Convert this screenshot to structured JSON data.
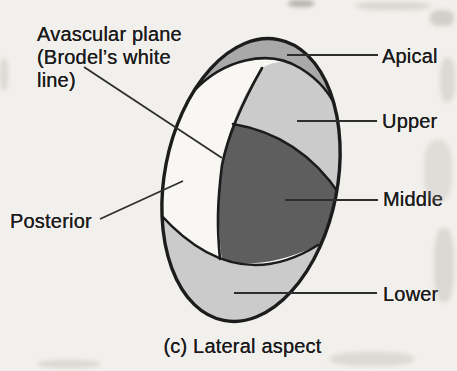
{
  "figure": {
    "caption": "(c) Lateral aspect",
    "labels": {
      "avascular_plane": "Avascular plane\n(Brodel’s white\nline)",
      "posterior": "Posterior",
      "apical": "Apical",
      "upper": "Upper",
      "middle": "Middle",
      "lower": "Lower"
    },
    "segments": {
      "apical": {
        "name": "Apical segment",
        "color": "#a9a9a9"
      },
      "upper": {
        "name": "Upper segment",
        "color": "#cbcbcb"
      },
      "middle": {
        "name": "Middle segment",
        "color": "#5e5e5e"
      },
      "lower": {
        "name": "Lower segment",
        "color": "#cbcbcb"
      },
      "posterior": {
        "name": "Posterior segment",
        "color": "#f8f7f4"
      }
    },
    "colors": {
      "background": "#f2f0ec",
      "ink": "#1c1c1c",
      "leader_line": "#2e2e2e"
    }
  }
}
